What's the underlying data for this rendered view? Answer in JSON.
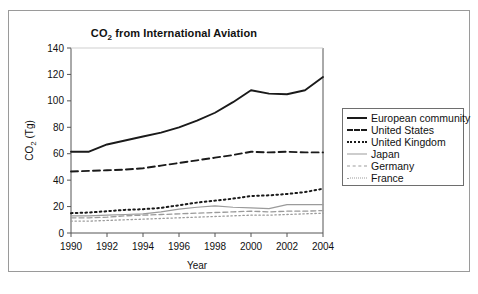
{
  "figure": {
    "title_main": "CO",
    "title_sub": "2",
    "title_rest": " from International Aviation"
  },
  "legend": {
    "items": [
      {
        "label": "European community",
        "style": "solid-dark",
        "color": "#1a1a1a"
      },
      {
        "label": "United States",
        "style": "dash-dark",
        "color": "#1a1a1a"
      },
      {
        "label": "United Kingdom",
        "style": "dot-dark",
        "color": "#1a1a1a"
      },
      {
        "label": "Japan",
        "style": "solid-gray",
        "color": "#9b9b9b"
      },
      {
        "label": "Germany",
        "style": "dash-gray",
        "color": "#9b9b9b"
      },
      {
        "label": "France",
        "style": "dot-gray",
        "color": "#9b9b9b"
      }
    ]
  },
  "chart_data": {
    "type": "line",
    "title": "CO2 from International Aviation",
    "xlabel": "Year",
    "ylabel": "CO2 (Tg)",
    "xlim": [
      1990,
      2004
    ],
    "ylim": [
      0,
      140
    ],
    "xticks": [
      1990,
      1992,
      1994,
      1996,
      1998,
      2000,
      2002,
      2004
    ],
    "xtick_labels": [
      "1990",
      "1992",
      "1994",
      "1996",
      "1998",
      "2000",
      "2002",
      "2004"
    ],
    "yticks": [
      0,
      20,
      40,
      60,
      80,
      100,
      120,
      140
    ],
    "ytick_labels": [
      "0",
      "20",
      "40",
      "60",
      "80",
      "100",
      "120",
      "140"
    ],
    "grid": false,
    "legend_position": "right",
    "x": [
      1990,
      1991,
      1992,
      1993,
      1994,
      1995,
      1996,
      1997,
      1998,
      1999,
      2000,
      2001,
      2002,
      2003,
      2004
    ],
    "series": [
      {
        "name": "European community",
        "values": [
          61.5,
          61.5,
          67,
          70,
          73,
          76,
          80,
          85,
          91,
          99,
          108,
          105.5,
          105,
          108,
          118
        ]
      },
      {
        "name": "United States",
        "values": [
          46.5,
          47,
          47.5,
          48,
          49,
          51,
          53,
          55,
          57,
          59,
          61.5,
          61,
          61.5,
          61,
          61
        ]
      },
      {
        "name": "United Kingdom",
        "values": [
          15,
          15.5,
          16.5,
          17.5,
          18,
          19,
          21,
          23,
          24.5,
          26,
          28,
          28.5,
          29.5,
          31,
          33.5
        ]
      },
      {
        "name": "Japan",
        "values": [
          13,
          13,
          13.5,
          14,
          14.5,
          16,
          18,
          19.5,
          20.5,
          19.5,
          19,
          18.5,
          21.5,
          21.5,
          21.5
        ]
      },
      {
        "name": "Germany",
        "values": [
          11.5,
          11.5,
          12,
          13,
          13.5,
          14,
          14.5,
          15,
          15.5,
          16,
          16.5,
          16,
          16.5,
          16.5,
          17
        ]
      },
      {
        "name": "France",
        "values": [
          9,
          9,
          9.5,
          10,
          10.5,
          11,
          11.5,
          12,
          12.5,
          13,
          13.5,
          13.5,
          14,
          14.5,
          15
        ]
      }
    ]
  }
}
